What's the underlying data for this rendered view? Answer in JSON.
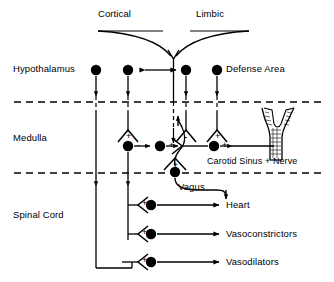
{
  "figure": {
    "type": "neuroanatomical-block-diagram"
  },
  "colors": {
    "ink": "#000000",
    "background": "#ffffff"
  },
  "labels": {
    "cortical": "Cortical",
    "limbic": "Limbic",
    "hypothalamus": "Hypothalamus",
    "defense_area": "Defense Area",
    "medulla": "Medulla",
    "carotid": "Carotid Sinus + Nerve",
    "spinal_cord": "Spinal Cord",
    "vagus": "Vagus",
    "heart": "Heart",
    "vasoconstrictors": "Vasoconstrictors",
    "vasodilators": "Vasodilators"
  },
  "signs": {
    "hypo_plus": "+",
    "med_plus_1": "+",
    "med_minus_1": "-",
    "med_plus_2": "+",
    "med_minus_2": "-",
    "med_plus_3": "+",
    "med_plus_4": "+",
    "baro_plus": "+",
    "spinal_plus_1": "+",
    "spinal_plus_2": "+",
    "spinal_plus_3": "+",
    "carotid_plus": "+"
  },
  "levels": [
    {
      "name": "Hypothalamus",
      "y": 70
    },
    {
      "name": "Medulla",
      "y": 138
    },
    {
      "name": "Spinal Cord",
      "y": 215
    }
  ],
  "boundaries": [
    {
      "name": "hypothalamus-medulla-boundary",
      "y": 102
    },
    {
      "name": "medulla-spinal-boundary",
      "y": 173
    }
  ],
  "nodes": [
    {
      "name": "hypothalamus-node-1",
      "x": 96,
      "y": 70
    },
    {
      "name": "hypothalamus-node-2",
      "x": 128,
      "y": 70
    },
    {
      "name": "hypothalamus-node-3",
      "x": 186,
      "y": 70
    },
    {
      "name": "hypothalamus-node-4",
      "x": 217,
      "y": 70
    },
    {
      "name": "medulla-node-1",
      "x": 128,
      "y": 146
    },
    {
      "name": "medulla-node-2",
      "x": 160,
      "y": 146
    },
    {
      "name": "medulla-node-3",
      "x": 214,
      "y": 146
    },
    {
      "name": "baroreceptor-node",
      "x": 175,
      "y": 172
    },
    {
      "name": "spinal-node-heart",
      "x": 151,
      "y": 205
    },
    {
      "name": "spinal-node-vasoconstrictor",
      "x": 151,
      "y": 234
    },
    {
      "name": "spinal-node-vasodilator",
      "x": 151,
      "y": 262
    }
  ],
  "outputs": [
    {
      "name": "heart-output",
      "label": "Heart",
      "y": 205
    },
    {
      "name": "vasoconstrictor-output",
      "label": "Vasoconstrictors",
      "y": 234
    },
    {
      "name": "vasodilator-output",
      "label": "Vasodilators",
      "y": 262
    }
  ]
}
